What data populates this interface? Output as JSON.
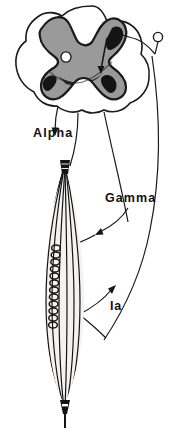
{
  "figure": {
    "background_color": "#ffffff",
    "ink_color": "#111111"
  },
  "labels": {
    "alpha": "Alpha",
    "gamma": "Gamma",
    "ia": "Ia"
  },
  "structures": {
    "spinal_cord": {
      "name": "spinal-cord-cross-section",
      "white_matter_fill": "#ffffff",
      "gray_matter_fill": "#9a9a9a",
      "gray_matter_outline": "#1a1a1a",
      "central_canal_fill": "#ffffff",
      "motor_neuron_fill": "#141414"
    },
    "dorsal_root_ganglion": {
      "name": "dorsal-root-ganglion-cell",
      "fill": "#ffffff",
      "outline": "#1a1a1a"
    },
    "muscle_spindle": {
      "name": "muscle-spindle",
      "capsule_fill": "#f2f2f0",
      "fiber_stroke": "#141414",
      "annulospiral_ending_stroke": "#141414",
      "tendon_fill": "#141414"
    }
  },
  "arrows": {
    "alpha": "alpha-motor-arrow",
    "gamma": "gamma-motor-arrow",
    "ia": "ia-afferent-arrow"
  }
}
